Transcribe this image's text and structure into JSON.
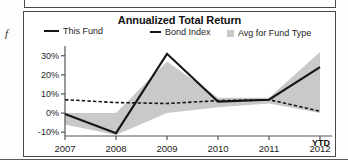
{
  "page": {
    "margin_glyph": "f"
  },
  "chart_panel": {
    "title": "Annualized Total Return",
    "legend": [
      {
        "key": "this-fund",
        "label": "This Fund",
        "marker": "solid-line",
        "color": "#151515"
      },
      {
        "key": "bond-index",
        "label": "Bond Index",
        "marker": "dashed-line",
        "color": "#151515"
      },
      {
        "key": "avg-for-fund-type",
        "label": "Avg for Fund Type",
        "marker": "filled-square",
        "color": "#c9c9c9"
      }
    ],
    "ytd_label": "YTD"
  },
  "chart_data": {
    "type": "line",
    "title": "Annualized Total Return",
    "xlabel": "",
    "ylabel": "",
    "x": [
      "2007",
      "2008",
      "2009",
      "2010",
      "2011",
      "2012"
    ],
    "x_tick_labels": [
      "2007",
      "2008",
      "2009",
      "2010",
      "2011",
      "2012"
    ],
    "x_axis_suffix": "YTD",
    "y_tick_labels": [
      "30%",
      "20%",
      "10%",
      "0%",
      "-10%"
    ],
    "y_tick_values": [
      30,
      20,
      10,
      0,
      -10
    ],
    "ylim": [
      -12,
      33
    ],
    "grid": false,
    "legend_position": "top",
    "series": [
      {
        "name": "This Fund",
        "style": "solid",
        "color": "#151515",
        "values": [
          -0.5,
          -10.5,
          31.0,
          6.0,
          7.0,
          24.0
        ]
      },
      {
        "name": "Bond Index",
        "style": "dashed",
        "color": "#151515",
        "values": [
          7.0,
          5.5,
          5.0,
          6.5,
          7.0,
          1.0
        ]
      },
      {
        "name": "Avg for Fund Type",
        "style": "band",
        "color": "#c9c9c9",
        "band_upper": [
          0.0,
          0.0,
          27.0,
          8.0,
          8.0,
          32.0
        ],
        "band_lower": [
          -6.0,
          -11.5,
          0.0,
          3.0,
          5.0,
          0.0
        ]
      }
    ]
  }
}
